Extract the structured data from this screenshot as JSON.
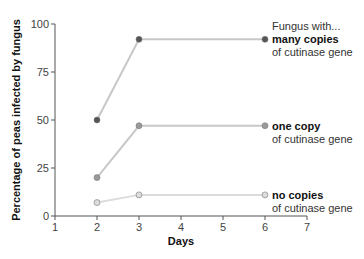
{
  "chart_data": {
    "type": "line",
    "title": "",
    "xlabel": "Days",
    "ylabel": "Percentage of peas infected by fungus",
    "xlim": [
      1,
      7
    ],
    "ylim": [
      0,
      100
    ],
    "x_ticks": [
      "1",
      "2",
      "3",
      "4",
      "5",
      "6",
      "7"
    ],
    "y_ticks": [
      "0",
      "25",
      "50",
      "75",
      "100"
    ],
    "grid": false,
    "legend_position": "right, inline labels",
    "legend_heading": "Fungus with...",
    "x": [
      2,
      3,
      6
    ],
    "series": [
      {
        "name": "many copies",
        "sublabel": "of cutinase gene",
        "values": [
          50,
          92,
          92
        ],
        "marker_color": "#555555",
        "line_color": "#c8c8c8"
      },
      {
        "name": "one copy",
        "sublabel": "of cutinase gene",
        "values": [
          20,
          47,
          47
        ],
        "marker_color": "#9a9a9a",
        "line_color": "#c8c8c8"
      },
      {
        "name": "no copies",
        "sublabel": "of cutinase gene",
        "values": [
          7,
          11,
          11
        ],
        "marker_color": "#dcdcdc",
        "line_color": "#dcdcdc"
      }
    ]
  }
}
